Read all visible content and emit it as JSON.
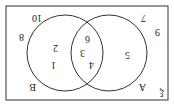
{
  "diagram": {
    "type": "venn",
    "orientation": "rotated-180",
    "universal_label": "ξ",
    "sets": [
      {
        "name": "A",
        "label": "A"
      },
      {
        "name": "B",
        "label": "B"
      }
    ],
    "regions": {
      "only_A": [
        "5"
      ],
      "A_and_B": [
        "3",
        "4",
        "6"
      ],
      "only_B": [
        "1",
        "2"
      ],
      "outside": [
        "7",
        "8",
        "9",
        "10"
      ]
    },
    "labels": {
      "xi": "ξ",
      "A": "A",
      "B": "B",
      "n1": "1",
      "n2": "2",
      "n3": "3",
      "n4": "4",
      "n5": "5",
      "n6": "6",
      "n7": "7",
      "n8": "8",
      "n9": "9",
      "n10": "10"
    },
    "colors": {
      "stroke": "#333333",
      "text": "#222222",
      "background": "#ffffff"
    }
  }
}
